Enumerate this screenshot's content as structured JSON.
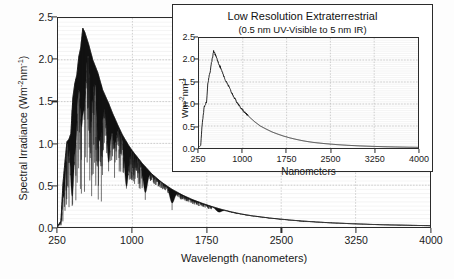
{
  "chart_data": [
    {
      "id": "main",
      "type": "line",
      "title": "",
      "xlabel": "Wavelength (nanometers)",
      "ylabel": "Spectral Irradiance (Wm-2nm-1)",
      "ylabel_parts": {
        "text": "Spectral Irradiance (Wm",
        "sup1": "-2",
        "mid": "nm",
        "sup2": "-1",
        "close": ")"
      },
      "xlim": [
        250,
        4000
      ],
      "ylim": [
        0.0,
        2.5
      ],
      "xticks": [
        250,
        1000,
        1750,
        2500,
        3250,
        4000
      ],
      "yticks": [
        "0.0",
        "0.5",
        "1.0",
        "1.5",
        "2.0",
        "2.5"
      ],
      "grid": true,
      "grid_style": "fine horizontal minor lines with dotted major gridlines",
      "series_name": "High resolution extraterrestrial solar spectrum",
      "description": "Dense high-resolution solar spectral irradiance with strong Fraunhofer absorption spikes; rises steeply from 250 nm, peaks near 2.4 around 450-500 nm, decays smoothly to near 0 by 4000 nm",
      "envelope_x": [
        250,
        280,
        300,
        320,
        340,
        360,
        380,
        400,
        420,
        440,
        460,
        480,
        500,
        520,
        560,
        600,
        650,
        700,
        760,
        800,
        860,
        900,
        960,
        1000,
        1100,
        1200,
        1300,
        1400,
        1500,
        1600,
        1700,
        1800,
        1900,
        2000,
        2100,
        2200,
        2400,
        2600,
        2800,
        3000,
        3200,
        3400,
        3600,
        3800,
        4000
      ],
      "envelope_y": [
        0.02,
        0.07,
        0.52,
        0.78,
        1.02,
        1.05,
        1.12,
        1.55,
        1.72,
        1.82,
        2.04,
        2.15,
        2.38,
        2.33,
        2.18,
        2.0,
        1.85,
        1.64,
        1.48,
        1.36,
        1.2,
        1.1,
        0.98,
        0.91,
        0.76,
        0.63,
        0.53,
        0.45,
        0.385,
        0.33,
        0.285,
        0.245,
        0.21,
        0.18,
        0.155,
        0.135,
        0.105,
        0.082,
        0.064,
        0.05,
        0.04,
        0.031,
        0.025,
        0.02,
        0.016
      ],
      "absorption_dips": [
        {
          "x": 310,
          "depth": 0.45
        },
        {
          "x": 393,
          "depth": 0.55
        },
        {
          "x": 397,
          "depth": 0.5
        },
        {
          "x": 430,
          "depth": 0.4
        },
        {
          "x": 486,
          "depth": 0.45
        },
        {
          "x": 517,
          "depth": 0.35
        },
        {
          "x": 589,
          "depth": 0.3
        },
        {
          "x": 656,
          "depth": 0.4
        },
        {
          "x": 687,
          "depth": 0.3
        },
        {
          "x": 760,
          "depth": 0.5
        },
        {
          "x": 820,
          "depth": 0.25
        },
        {
          "x": 940,
          "depth": 0.55
        },
        {
          "x": 1130,
          "depth": 0.45
        },
        {
          "x": 1400,
          "depth": 0.38
        },
        {
          "x": 1870,
          "depth": 0.2
        },
        {
          "x": 2700,
          "depth": 0.07
        }
      ]
    },
    {
      "id": "inset",
      "type": "line",
      "title": "Low Resolution Extraterrestrial",
      "subtitle": "(0.5 nm UV-Visible to 5 nm IR)",
      "xlabel": "Nanometers",
      "ylabel": "Wm-2nm-1",
      "ylabel_parts": {
        "text": "Wm",
        "sup1": "-2",
        "mid": "nm",
        "sup2": "-1"
      },
      "xlim": [
        250,
        4000
      ],
      "ylim": [
        0.0,
        2.5
      ],
      "xticks": [
        250,
        1000,
        1750,
        2500,
        3250,
        4000
      ],
      "yticks": [
        "0.0",
        "0.5",
        "1.0",
        "1.5",
        "2.0",
        "2.5"
      ],
      "grid": true,
      "series_name": "Low resolution extraterrestrial solar spectrum",
      "description": "Smoothed solar spectral irradiance curve peaking near 2.2 around 450-500 nm then decaying toward zero",
      "envelope_x": [
        250,
        280,
        300,
        320,
        340,
        360,
        380,
        400,
        420,
        440,
        460,
        480,
        500,
        520,
        560,
        600,
        650,
        700,
        760,
        800,
        860,
        900,
        960,
        1000,
        1100,
        1200,
        1300,
        1400,
        1500,
        1600,
        1700,
        1800,
        1900,
        2000,
        2100,
        2200,
        2400,
        2600,
        2800,
        3000,
        3200,
        3400,
        3600,
        3800,
        4000
      ],
      "envelope_y": [
        0.02,
        0.06,
        0.48,
        0.72,
        0.95,
        0.98,
        1.06,
        1.45,
        1.62,
        1.72,
        1.92,
        2.04,
        2.2,
        2.15,
        2.02,
        1.88,
        1.73,
        1.54,
        1.4,
        1.28,
        1.13,
        1.04,
        0.92,
        0.86,
        0.72,
        0.6,
        0.5,
        0.43,
        0.365,
        0.315,
        0.27,
        0.232,
        0.2,
        0.172,
        0.148,
        0.128,
        0.1,
        0.078,
        0.061,
        0.048,
        0.038,
        0.03,
        0.024,
        0.019,
        0.015
      ]
    }
  ],
  "colors": {
    "curve": "#111111",
    "axis": "#2b2b2b",
    "grid_minor": "#e2e2e2",
    "grid_major": "#b9b9b9",
    "background": "#fdfdfd",
    "panel": "#ffffff"
  }
}
